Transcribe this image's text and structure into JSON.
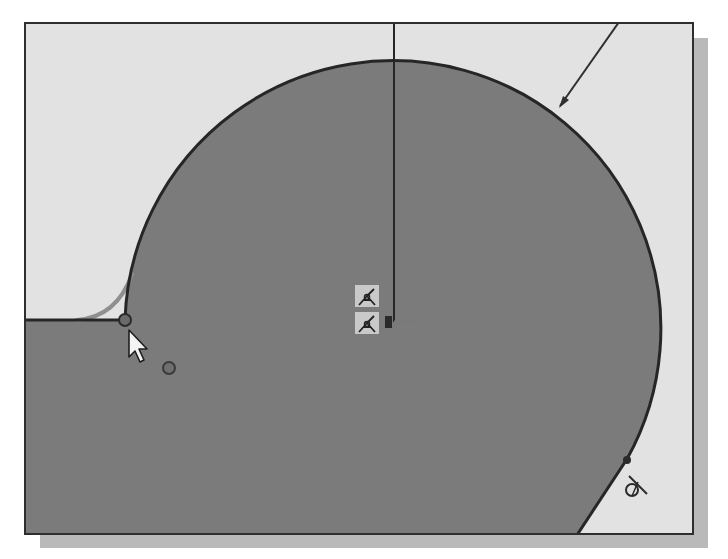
{
  "app": {
    "view": "sketch-viewport",
    "mode": "sketch-fillet"
  },
  "colors": {
    "background": "#ffffff",
    "viewport_bg": "#e2e2e2",
    "profile_fill": "#7b7b7b",
    "sketch_line": "#262626",
    "fillet_preview": "#8f8f8f",
    "frame_shadow": "#b9b9b9",
    "constraint_icon_bg": "#c9c9c9"
  },
  "sketch": {
    "arc": {
      "center": [
        392,
        320
      ],
      "radius": 268
    },
    "horizontal_line": {
      "from": [
        0,
        318
      ],
      "to": [
        123,
        318
      ]
    },
    "vertical_center_line": {
      "from": [
        392,
        22
      ],
      "to": [
        392,
        320
      ]
    },
    "tangent_line": {
      "from": [
        625,
        457
      ],
      "to": [
        575,
        531
      ]
    },
    "leader_line": {
      "from": [
        617,
        22
      ],
      "to": [
        557,
        106
      ]
    },
    "fillet_preview_arc": {
      "from": [
        75,
        318
      ],
      "to": [
        130,
        270
      ]
    },
    "endpoint_marker": {
      "x": 123,
      "y": 318
    },
    "snap_dot": {
      "x": 167,
      "y": 366
    }
  },
  "constraints": {
    "icons": [
      {
        "name": "coincident-constraint-icon",
        "x": 353,
        "y": 283
      },
      {
        "name": "coincident-constraint-icon",
        "x": 353,
        "y": 310
      }
    ],
    "tangent_icon": {
      "x": 620,
      "y": 478,
      "glyph": "tangent"
    }
  },
  "cursor": {
    "x": 127,
    "y": 330,
    "type": "arrow"
  }
}
